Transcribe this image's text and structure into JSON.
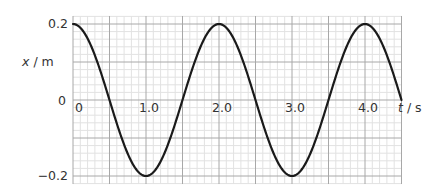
{
  "chart_data": {
    "type": "line",
    "title": "",
    "xlabel": "t / s",
    "ylabel": "x / m",
    "xlabel_var": "t",
    "xlabel_unit": "s",
    "ylabel_var": "x",
    "ylabel_unit": "m",
    "xlim": [
      0,
      4.5
    ],
    "ylim": [
      -0.2,
      0.2
    ],
    "grid": true,
    "x_ticks": [
      {
        "value": 0,
        "label": "0"
      },
      {
        "value": 1.0,
        "label": "1.0"
      },
      {
        "value": 2.0,
        "label": "2.0"
      },
      {
        "value": 3.0,
        "label": "3.0"
      },
      {
        "value": 4.0,
        "label": "4.0"
      }
    ],
    "y_ticks": [
      {
        "value": 0.2,
        "label": "0.2"
      },
      {
        "value": 0,
        "label": "0"
      },
      {
        "value": -0.2,
        "label": "−0.2"
      }
    ],
    "series": [
      {
        "name": "displacement",
        "function": "x = 0.2 cos(pi t)",
        "amplitude": 0.2,
        "period": 2.0,
        "x": [
          0,
          0.5,
          1.0,
          1.5,
          2.0,
          2.5,
          3.0,
          3.5,
          4.0,
          4.5
        ],
        "values": [
          0.2,
          0,
          -0.2,
          0,
          0.2,
          0,
          -0.2,
          0,
          0.2,
          0
        ],
        "color": "#1a1a1a"
      }
    ],
    "legend": null
  },
  "style": {
    "minor_grid_color": "#e2e2e2",
    "major_grid_color": "#a8a8a8",
    "curve_color": "#1a1a1a",
    "label_color": "#333333"
  }
}
